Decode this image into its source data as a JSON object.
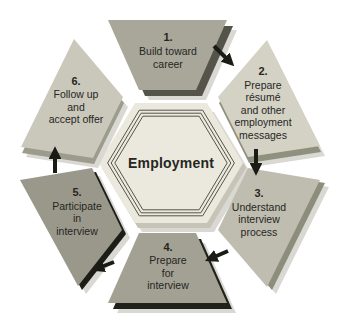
{
  "diagram": {
    "center": {
      "label": "Employment"
    },
    "steps": [
      {
        "number": "1.",
        "lines": [
          "Build toward",
          "career"
        ],
        "color": "#a8a79a",
        "edge": "#54544a"
      },
      {
        "number": "2.",
        "lines": [
          "Prepare",
          "résumé",
          "and other",
          "employment",
          "messages"
        ],
        "color": "#d4d2c5",
        "edge": "#90907f"
      },
      {
        "number": "3.",
        "lines": [
          "Understand",
          "interview",
          "process"
        ],
        "color": "#bfbdaf",
        "edge": "#8d8d7c"
      },
      {
        "number": "4.",
        "lines": [
          "Prepare",
          "for",
          "interview"
        ],
        "color": "#a3a094",
        "edge": "#21211b"
      },
      {
        "number": "5.",
        "lines": [
          "Participate",
          "in",
          "interview"
        ],
        "color": "#99988b",
        "edge": "#1d1d18"
      },
      {
        "number": "6.",
        "lines": [
          "Follow up",
          "and",
          "accept offer"
        ],
        "color": "#cac8bb",
        "edge": "#9c9c8c"
      }
    ],
    "flow": [
      {
        "from": "1",
        "to": "2"
      },
      {
        "from": "2",
        "to": "3"
      },
      {
        "from": "3",
        "to": "4"
      },
      {
        "from": "4",
        "to": "5"
      },
      {
        "from": "5",
        "to": "6"
      }
    ],
    "colors": {
      "arrow": "#1b1b16",
      "text": "#26261f",
      "center_fill": "#ebe9dd",
      "center_edge": "#c6c4b6",
      "center_ring": "#55544b",
      "shadow": "#d9d8d2",
      "background": "#ffffff"
    }
  }
}
